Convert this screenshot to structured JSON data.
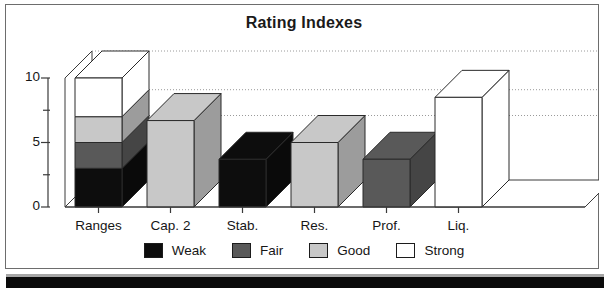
{
  "chart_data": {
    "type": "bar",
    "title": "Rating Indexes",
    "xlabel": "",
    "ylabel": "",
    "ylim": [
      0,
      10
    ],
    "yticks": [
      0,
      5,
      10
    ],
    "ytick_labels": [
      "0",
      "5",
      "10"
    ],
    "minor_yticks": [
      2.5,
      7.5
    ],
    "grid": true,
    "grid_style": "dotted",
    "legend_position": "bottom",
    "three_d": true,
    "categories": [
      "Ranges",
      "Cap. 2",
      "Stab.",
      "Res.",
      "Prof.",
      "Liq."
    ],
    "series": [
      {
        "name": "Weak",
        "color": "#0d0d0d",
        "values": [
          3,
          0,
          3.7,
          0,
          0,
          0
        ]
      },
      {
        "name": "Fair",
        "color": "#595959",
        "values": [
          2,
          0,
          0,
          0,
          3.7,
          0
        ]
      },
      {
        "name": "Good",
        "color": "#c8c8c8",
        "values": [
          2,
          6.7,
          0,
          5,
          0,
          0
        ]
      },
      {
        "name": "Strong",
        "color": "#ffffff",
        "values": [
          3,
          0,
          0,
          0,
          0,
          8.5
        ]
      }
    ],
    "stacked_totals": [
      10,
      6.7,
      3.7,
      5,
      3.7,
      8.5
    ]
  },
  "legend": {
    "items": [
      {
        "label": "Weak",
        "color": "#0d0d0d"
      },
      {
        "label": "Fair",
        "color": "#595959"
      },
      {
        "label": "Good",
        "color": "#c8c8c8"
      },
      {
        "label": "Strong",
        "color": "#ffffff"
      }
    ]
  },
  "axis": {
    "y_tick_labels": [
      "10",
      "5",
      "0"
    ],
    "x_tick_labels": [
      "Ranges",
      "Cap. 2",
      "Stab.",
      "Res.",
      "Prof.",
      "Liq."
    ]
  }
}
